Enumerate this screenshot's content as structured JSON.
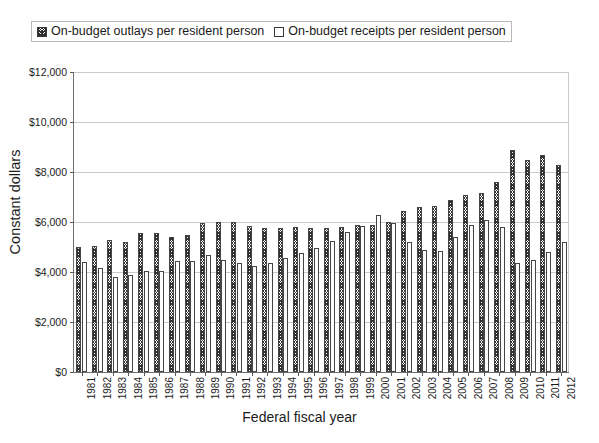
{
  "chart_data": {
    "type": "bar",
    "title": "",
    "xlabel": "Federal fiscal year",
    "ylabel": "Constant dollars",
    "ylim": [
      0,
      12000
    ],
    "ytick_values": [
      0,
      2000,
      4000,
      6000,
      8000,
      10000,
      12000
    ],
    "ytick_labels": [
      "$0",
      "$2,000",
      "$4,000",
      "$6,000",
      "$8,000",
      "$10,000",
      "$12,000"
    ],
    "grid": true,
    "legend_position": "top",
    "categories": [
      "1981",
      "1982",
      "1983",
      "1984",
      "1985",
      "1986",
      "1987",
      "1988",
      "1989",
      "1990",
      "1991",
      "1992",
      "1993",
      "1994",
      "1995",
      "1996",
      "1997",
      "1998",
      "1999",
      "2000",
      "2001",
      "2002",
      "2003",
      "2004",
      "2005",
      "2006",
      "2007",
      "2008",
      "2009",
      "2010",
      "2011",
      "2012"
    ],
    "series": [
      {
        "name": "On-budget outlays per resident person",
        "pattern": "hatch",
        "values": [
          5000,
          5050,
          5300,
          5200,
          5550,
          5550,
          5400,
          5500,
          5950,
          6000,
          6000,
          5850,
          5750,
          5750,
          5800,
          5750,
          5750,
          5800,
          5900,
          5900,
          6000,
          6450,
          6600,
          6650,
          6900,
          7100,
          7150,
          7600,
          8900,
          8500,
          8700,
          8300
        ]
      },
      {
        "name": "On-budget receipts per resident person",
        "pattern": "plain",
        "values": [
          4400,
          4150,
          3800,
          3900,
          4050,
          4050,
          4450,
          4450,
          4700,
          4500,
          4350,
          4250,
          4350,
          4550,
          4750,
          4950,
          5250,
          5600,
          5850,
          6300,
          5950,
          5200,
          4900,
          4850,
          5400,
          5900,
          6100,
          5800,
          4350,
          4500,
          4800,
          5200
        ]
      }
    ]
  },
  "legend": {
    "entries": [
      {
        "label": "On-budget outlays per resident person",
        "swatch": "hatch-swatch-icon"
      },
      {
        "label": "On-budget receipts per resident person",
        "swatch": "empty-swatch-icon"
      }
    ]
  },
  "axes": {
    "y_title": "Constant dollars",
    "x_title": "Federal fiscal year"
  },
  "colors": {
    "bar_outline": "#454545",
    "hatch": "#303030",
    "receipts_fill": "#fdfdfd",
    "gridline": "#c9c9c9",
    "axis": "#6e6e6e",
    "text": "#1b1b1b"
  }
}
